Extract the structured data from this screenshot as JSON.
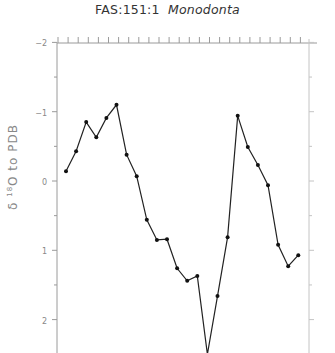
{
  "title": {
    "prefix": "FAS:151:1",
    "species": "Monodonta"
  },
  "ylabel": {
    "delta": "δ",
    "isotope": "18",
    "rest": "O to PDB"
  },
  "chart_data": {
    "type": "line",
    "xlabel": "",
    "ylabel": "δ 18O to PDB",
    "y_inverted": true,
    "ylim": [
      -2,
      2.5
    ],
    "yticks": [
      -2,
      -1,
      0,
      1,
      2
    ],
    "ytick_labels": [
      "-2",
      "-1",
      "0",
      "1",
      "2"
    ],
    "grid": false,
    "legend": null,
    "x": [
      1,
      2,
      3,
      4,
      5,
      6,
      7,
      8,
      9,
      10,
      11,
      12,
      13,
      14,
      15,
      16,
      17,
      18,
      19,
      20,
      21,
      22,
      23,
      24
    ],
    "series": [
      {
        "name": "Monodonta",
        "values": [
          -0.14,
          -0.43,
          -0.85,
          -0.63,
          -0.91,
          -1.1,
          -0.38,
          -0.07,
          0.56,
          0.85,
          0.84,
          1.26,
          1.44,
          1.37,
          2.5,
          1.66,
          0.81,
          -0.94,
          -0.49,
          -0.23,
          0.06,
          0.92,
          1.23,
          1.07
        ]
      }
    ]
  }
}
